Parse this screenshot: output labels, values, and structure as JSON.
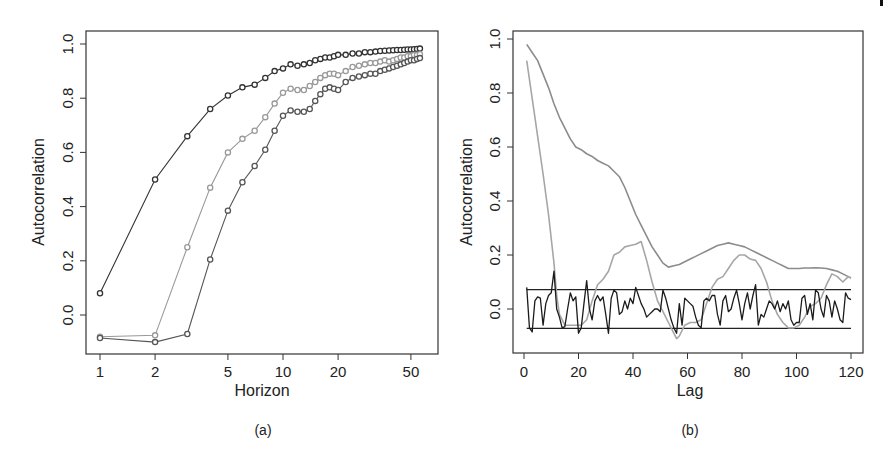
{
  "chart_data": [
    {
      "panel": "(a)",
      "type": "line",
      "xlabel": "Horizon",
      "ylabel": "Autocorrelation",
      "xscale": "log",
      "xlim": [
        0.88,
        64
      ],
      "ylim": [
        -0.14,
        1.05
      ],
      "xticks": [
        1,
        2,
        5,
        10,
        20,
        50
      ],
      "yticks": [
        0.0,
        0.2,
        0.4,
        0.6,
        0.8,
        1.0
      ],
      "ytick_labels": [
        "0.0",
        "0.2",
        "0.4",
        "0.6",
        "0.8",
        "1.0"
      ],
      "grid": false,
      "legend": null,
      "markers": "open-circle",
      "series": [
        {
          "name": "series-1",
          "color": "#333333",
          "x": [
            1,
            2,
            3,
            4,
            5,
            6,
            7,
            8,
            9,
            10,
            11,
            12,
            13,
            14,
            15,
            16,
            17,
            18,
            19,
            20,
            22,
            24,
            26,
            28,
            30,
            32,
            34,
            36,
            38,
            40,
            42,
            44,
            46,
            48,
            50,
            52,
            54,
            56
          ],
          "values": [
            0.08,
            0.5,
            0.66,
            0.76,
            0.81,
            0.84,
            0.85,
            0.875,
            0.9,
            0.91,
            0.925,
            0.92,
            0.925,
            0.93,
            0.94,
            0.945,
            0.95,
            0.95,
            0.955,
            0.96,
            0.96,
            0.965,
            0.965,
            0.97,
            0.97,
            0.972,
            0.974,
            0.975,
            0.976,
            0.977,
            0.978,
            0.978,
            0.979,
            0.98,
            0.98,
            0.981,
            0.982,
            0.983
          ]
        },
        {
          "name": "series-2",
          "color": "#999999",
          "x": [
            1,
            2,
            3,
            4,
            5,
            6,
            7,
            8,
            9,
            10,
            11,
            12,
            13,
            14,
            15,
            16,
            17,
            18,
            19,
            20,
            22,
            24,
            26,
            28,
            30,
            32,
            34,
            36,
            38,
            40,
            42,
            44,
            46,
            48,
            50,
            52,
            54,
            56
          ],
          "values": [
            -0.08,
            -0.075,
            0.25,
            0.47,
            0.6,
            0.65,
            0.68,
            0.73,
            0.78,
            0.82,
            0.835,
            0.83,
            0.83,
            0.845,
            0.86,
            0.875,
            0.885,
            0.89,
            0.89,
            0.885,
            0.9,
            0.915,
            0.92,
            0.925,
            0.93,
            0.93,
            0.935,
            0.94,
            0.935,
            0.94,
            0.945,
            0.95,
            0.95,
            0.955,
            0.955,
            0.96,
            0.96,
            0.962
          ]
        },
        {
          "name": "series-3",
          "color": "#555555",
          "x": [
            1,
            2,
            3,
            4,
            5,
            6,
            7,
            8,
            9,
            10,
            11,
            12,
            13,
            14,
            15,
            16,
            17,
            18,
            19,
            20,
            22,
            24,
            26,
            28,
            30,
            32,
            34,
            36,
            38,
            40,
            42,
            44,
            46,
            48,
            50,
            52,
            54,
            56
          ],
          "values": [
            -0.085,
            -0.1,
            -0.07,
            0.205,
            0.385,
            0.49,
            0.55,
            0.61,
            0.68,
            0.735,
            0.755,
            0.75,
            0.75,
            0.76,
            0.79,
            0.815,
            0.835,
            0.84,
            0.835,
            0.83,
            0.86,
            0.875,
            0.88,
            0.885,
            0.89,
            0.89,
            0.9,
            0.905,
            0.91,
            0.915,
            0.92,
            0.925,
            0.93,
            0.935,
            0.94,
            0.94,
            0.945,
            0.948
          ]
        }
      ]
    },
    {
      "panel": "(b)",
      "type": "line",
      "xlabel": "Lag",
      "ylabel": "Autocorrelation",
      "xlim": [
        -4,
        124
      ],
      "ylim": [
        -0.16,
        1.05
      ],
      "xticks": [
        0,
        20,
        40,
        60,
        80,
        100,
        120
      ],
      "yticks": [
        0.0,
        0.2,
        0.4,
        0.6,
        0.8,
        1.0
      ],
      "ytick_labels": [
        "0.0",
        "0.2",
        "0.4",
        "0.6",
        "0.8",
        "1.0"
      ],
      "grid": false,
      "legend": null,
      "confidence_bounds": [
        0.072,
        -0.072
      ],
      "series": [
        {
          "name": "smooth-slow-decay",
          "color": "#8c8c8c",
          "x": [
            1,
            3,
            5,
            7,
            9,
            11,
            13,
            15,
            17,
            19,
            21,
            23,
            25,
            27,
            29,
            31,
            33,
            35,
            37,
            39,
            41,
            43,
            45,
            47,
            49,
            51,
            53,
            55,
            57,
            59,
            61,
            63,
            65,
            67,
            69,
            71,
            73,
            75,
            77,
            79,
            81,
            83,
            85,
            87,
            89,
            91,
            93,
            95,
            97,
            99,
            101,
            103,
            105,
            107,
            109,
            111,
            113,
            115,
            117,
            119,
            120
          ],
          "values": [
            0.98,
            0.95,
            0.92,
            0.87,
            0.82,
            0.76,
            0.71,
            0.67,
            0.63,
            0.6,
            0.59,
            0.575,
            0.565,
            0.55,
            0.54,
            0.53,
            0.51,
            0.49,
            0.45,
            0.4,
            0.35,
            0.31,
            0.27,
            0.23,
            0.2,
            0.17,
            0.155,
            0.16,
            0.165,
            0.175,
            0.185,
            0.195,
            0.205,
            0.215,
            0.225,
            0.235,
            0.24,
            0.245,
            0.24,
            0.235,
            0.23,
            0.22,
            0.21,
            0.2,
            0.19,
            0.18,
            0.17,
            0.16,
            0.15,
            0.15,
            0.15,
            0.152,
            0.152,
            0.153,
            0.152,
            0.15,
            0.145,
            0.14,
            0.13,
            0.12,
            0.115
          ]
        },
        {
          "name": "oscillating-decay",
          "color": "#a6a6a6",
          "x": [
            1,
            3,
            5,
            7,
            9,
            11,
            12,
            13,
            15,
            17,
            19,
            21,
            23,
            25,
            27,
            29,
            31,
            33,
            35,
            37,
            39,
            41,
            43,
            45,
            47,
            49,
            51,
            53,
            55,
            56,
            57,
            59,
            61,
            63,
            65,
            67,
            69,
            71,
            73,
            75,
            77,
            79,
            81,
            83,
            85,
            87,
            89,
            91,
            93,
            95,
            97,
            99,
            101,
            103,
            105,
            107,
            109,
            111,
            113,
            115,
            117,
            119,
            120
          ],
          "values": [
            0.92,
            0.78,
            0.64,
            0.5,
            0.35,
            0.17,
            0.05,
            -0.02,
            -0.06,
            -0.06,
            -0.06,
            -0.06,
            -0.04,
            0.03,
            0.09,
            0.11,
            0.14,
            0.2,
            0.21,
            0.23,
            0.235,
            0.24,
            0.25,
            0.18,
            0.1,
            0.03,
            -0.01,
            -0.05,
            -0.09,
            -0.11,
            -0.1,
            -0.06,
            -0.05,
            -0.05,
            -0.04,
            0.02,
            0.08,
            0.11,
            0.12,
            0.15,
            0.18,
            0.2,
            0.2,
            0.185,
            0.18,
            0.15,
            0.1,
            0.03,
            -0.02,
            -0.05,
            -0.07,
            -0.07,
            -0.06,
            -0.03,
            0.01,
            0.02,
            0.04,
            0.09,
            0.13,
            0.12,
            0.1,
            0.12,
            0.115
          ]
        },
        {
          "name": "noise-acf",
          "color": "#1a1a1a",
          "x": [
            1,
            2,
            3,
            4,
            5,
            6,
            7,
            8,
            9,
            10,
            11,
            12,
            13,
            14,
            15,
            16,
            17,
            18,
            19,
            20,
            21,
            22,
            23,
            24,
            25,
            26,
            27,
            28,
            29,
            30,
            31,
            32,
            33,
            34,
            35,
            36,
            37,
            38,
            39,
            40,
            41,
            42,
            43,
            44,
            45,
            46,
            47,
            48,
            49,
            50,
            51,
            52,
            53,
            54,
            55,
            56,
            57,
            58,
            59,
            60,
            61,
            62,
            63,
            64,
            65,
            66,
            67,
            68,
            69,
            70,
            71,
            72,
            73,
            74,
            75,
            76,
            77,
            78,
            79,
            80,
            81,
            82,
            83,
            84,
            85,
            86,
            87,
            88,
            89,
            90,
            91,
            92,
            93,
            94,
            95,
            96,
            97,
            98,
            99,
            100,
            101,
            102,
            103,
            104,
            105,
            106,
            107,
            108,
            109,
            110,
            111,
            112,
            113,
            114,
            115,
            116,
            117,
            118,
            119,
            120
          ],
          "values": [
            0.08,
            -0.07,
            -0.085,
            0.03,
            0.045,
            0.04,
            -0.06,
            0.02,
            0.05,
            0.06,
            0.14,
            0.0,
            -0.03,
            -0.07,
            -0.065,
            0.0,
            0.06,
            0.03,
            0.045,
            -0.09,
            -0.07,
            0.02,
            0.105,
            0.0,
            -0.04,
            0.03,
            0.05,
            0.03,
            0.045,
            -0.02,
            -0.09,
            0.04,
            0.07,
            0.06,
            -0.02,
            -0.01,
            0.03,
            0.0,
            0.04,
            0.02,
            0.08,
            0.05,
            0.02,
            0.0,
            -0.03,
            -0.02,
            -0.01,
            0.0,
            0.0,
            -0.01,
            0.07,
            0.04,
            0.0,
            -0.04,
            -0.07,
            -0.09,
            0.02,
            -0.06,
            0.04,
            0.03,
            0.02,
            0.01,
            -0.03,
            -0.06,
            -0.07,
            0.03,
            0.04,
            0.03,
            0.05,
            0.05,
            -0.02,
            -0.06,
            0.03,
            0.05,
            -0.01,
            0.0,
            0.04,
            0.07,
            0.02,
            -0.04,
            0.02,
            0.06,
            0.0,
            0.05,
            0.09,
            -0.06,
            -0.02,
            -0.03,
            0.0,
            0.03,
            0.02,
            0.0,
            0.03,
            -0.01,
            0.02,
            0.0,
            0.03,
            -0.04,
            -0.06,
            -0.05,
            -0.05,
            0.04,
            0.05,
            -0.02,
            0.02,
            -0.04,
            0.07,
            0.06,
            0.0,
            -0.03,
            0.05,
            0.03,
            -0.03,
            0.03,
            0.0,
            -0.04,
            -0.05,
            0.06,
            0.04,
            0.035
          ]
        }
      ]
    }
  ],
  "panels": {
    "a": {
      "label": "(a)",
      "xlabel": "Horizon",
      "ylabel": "Autocorrelation"
    },
    "b": {
      "label": "(b)",
      "xlabel": "Lag",
      "ylabel": "Autocorrelation"
    }
  }
}
